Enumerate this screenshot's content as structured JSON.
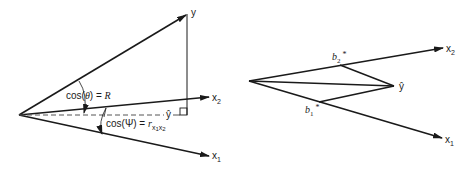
{
  "left_diagram": {
    "labels": {
      "y": "y",
      "x2": "x",
      "x2_sub": "2",
      "x1": "x",
      "x1_sub": "1",
      "yhat": "ŷ",
      "theta_eq_prefix": "cos(",
      "theta_symbol": "θ",
      "theta_eq_suffix": ") = ",
      "theta_rhs": "R",
      "psi_eq_prefix": "cos(Ψ) = ",
      "psi_rhs": "r",
      "psi_sub": "x",
      "psi_sub1": "1",
      "psi_sub2": "x",
      "psi_sub3": "2"
    }
  },
  "right_diagram": {
    "labels": {
      "x2": "x",
      "x2_sub": "2",
      "x1": "x",
      "x1_sub": "1",
      "yhat": "ŷ",
      "b2": "b",
      "b2_sub": "2",
      "b2_star": "*",
      "b1": "b",
      "b1_sub": "1",
      "b1_star": "*"
    }
  },
  "colors": {
    "stroke": "#1a1a1a",
    "dashed": "#555555",
    "background": "#ffffff"
  }
}
